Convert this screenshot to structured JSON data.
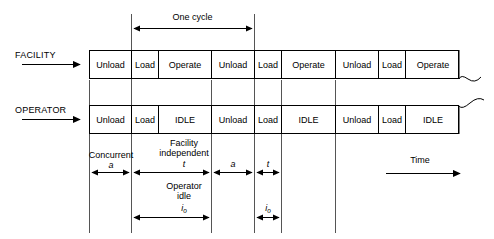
{
  "diagram": {
    "title_annotation": "One cycle",
    "time_axis_label": "Time",
    "rows": [
      {
        "name": "facility-row",
        "label": "FACILITY",
        "cells": [
          {
            "label": "Unload",
            "x": 89,
            "w": 42
          },
          {
            "label": "Load",
            "x": 131,
            "w": 27
          },
          {
            "label": "Operate",
            "x": 158,
            "w": 53
          },
          {
            "label": "Unload",
            "x": 211,
            "w": 43
          },
          {
            "label": "Load",
            "x": 254,
            "w": 27
          },
          {
            "label": "Operate",
            "x": 281,
            "w": 54
          },
          {
            "label": "Unload",
            "x": 335,
            "w": 43
          },
          {
            "label": "Load",
            "x": 378,
            "w": 27
          },
          {
            "label": "Operate",
            "x": 405,
            "w": 54
          }
        ]
      },
      {
        "name": "operator-row",
        "label": "OPERATOR",
        "cells": [
          {
            "label": "Unload",
            "x": 89,
            "w": 42
          },
          {
            "label": "Load",
            "x": 131,
            "w": 27
          },
          {
            "label": "IDLE",
            "x": 158,
            "w": 53
          },
          {
            "label": "Unload",
            "x": 211,
            "w": 43
          },
          {
            "label": "Load",
            "x": 254,
            "w": 27
          },
          {
            "label": "IDLE",
            "x": 281,
            "w": 54
          },
          {
            "label": "Unload",
            "x": 335,
            "w": 43
          },
          {
            "label": "Load",
            "x": 378,
            "w": 27
          },
          {
            "label": "IDLE",
            "x": 405,
            "w": 54
          }
        ]
      }
    ],
    "annotations": {
      "concurrent_label": "Concurrent",
      "concurrent_symbol": "a",
      "facility_independent_line1": "Facility",
      "facility_independent_line2": "independent",
      "facility_independent_symbol": "t",
      "operator_idle_line1": "Operator",
      "operator_idle_line2": "idle",
      "operator_idle_symbol_base": "i",
      "operator_idle_symbol_sub": "o",
      "second_concurrent_symbol": "a",
      "second_facility_symbol": "t",
      "second_idle_symbol_base": "i",
      "second_idle_symbol_sub": "o"
    }
  },
  "colors": {
    "stroke": "#000000",
    "guide": "#555555",
    "background": "#ffffff"
  }
}
